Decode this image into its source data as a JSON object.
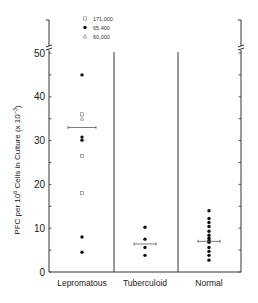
{
  "chart_data": {
    "type": "scatter",
    "title": "",
    "xlabel": "",
    "ylabel": "PFC per 10^6 Cells in Culture (x10^-3)",
    "ylabel_parts": {
      "main": "PFC per 10",
      "sup": "6",
      "rest": " Cells in Culture (x 10",
      "sup2": "−3",
      "end": ")"
    },
    "ylim": [
      0,
      50
    ],
    "yticks": [
      0,
      10,
      20,
      30,
      40,
      50
    ],
    "axis_break": true,
    "grid": false,
    "categories": [
      "Lepromatous",
      "Tuberculoid",
      "Normal"
    ],
    "legend": {
      "position": "top",
      "entries": [
        {
          "marker": "open-square",
          "label": "171,000"
        },
        {
          "marker": "filled-circle",
          "label": "65,400"
        },
        {
          "marker": "open-triangle",
          "label": "60,000"
        }
      ]
    },
    "series": [
      {
        "name": "Lepromatous",
        "points": [
          {
            "value": 45,
            "marker": "filled-circle"
          },
          {
            "value": 36,
            "marker": "open-square"
          },
          {
            "value": 35,
            "marker": "open-triangle"
          },
          {
            "value": 30.8,
            "marker": "filled-circle"
          },
          {
            "value": 30.1,
            "marker": "filled-circle"
          },
          {
            "value": 26.5,
            "marker": "open-square"
          },
          {
            "value": 18,
            "marker": "open-square"
          },
          {
            "value": 8,
            "marker": "filled-circle"
          },
          {
            "value": 4.5,
            "marker": "filled-circle"
          }
        ],
        "mean": 33,
        "sem": 3.5
      },
      {
        "name": "Tuberculoid",
        "points": [
          {
            "value": 10.2,
            "marker": "filled-circle"
          },
          {
            "value": 7.5,
            "marker": "filled-circle"
          },
          {
            "value": 5.6,
            "marker": "filled-circle"
          },
          {
            "value": 3.8,
            "marker": "filled-circle"
          }
        ],
        "mean": 6.4,
        "sem": 1.3
      },
      {
        "name": "Normal",
        "points": [
          {
            "value": 14,
            "marker": "filled-circle"
          },
          {
            "value": 12.2,
            "marker": "filled-circle"
          },
          {
            "value": 11.3,
            "marker": "filled-circle"
          },
          {
            "value": 10.4,
            "marker": "filled-circle"
          },
          {
            "value": 9.3,
            "marker": "filled-circle"
          },
          {
            "value": 8.4,
            "marker": "filled-circle"
          },
          {
            "value": 7.7,
            "marker": "filled-circle"
          },
          {
            "value": 7.2,
            "marker": "filled-circle"
          },
          {
            "value": 6.8,
            "marker": "filled-circle"
          },
          {
            "value": 5.6,
            "marker": "filled-circle"
          },
          {
            "value": 4.7,
            "marker": "filled-circle"
          },
          {
            "value": 3.8,
            "marker": "filled-circle"
          },
          {
            "value": 2.7,
            "marker": "filled-circle"
          }
        ],
        "mean": 7.0,
        "sem": 1.0
      }
    ]
  }
}
